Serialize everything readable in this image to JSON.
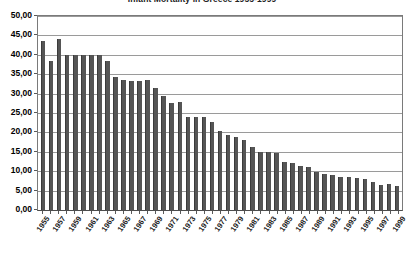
{
  "chart_data": {
    "type": "bar",
    "title": "Infant Mortality in Greece 1955-1999",
    "xlabel": "",
    "ylabel": "",
    "ylim": [
      0,
      50
    ],
    "ytick_step": 5,
    "grid": true,
    "legend": null,
    "decimal_separator": ",",
    "ytick_labels": [
      "50,00",
      "45,00",
      "40,00",
      "35,00",
      "30,00",
      "25,00",
      "20,00",
      "15,00",
      "10,00",
      "5,00",
      "0,00"
    ],
    "ytick_values": [
      50,
      45,
      40,
      35,
      30,
      25,
      20,
      15,
      10,
      5,
      0
    ],
    "xtick_labels": [
      "1955",
      "1957",
      "1959",
      "1961",
      "1963",
      "1965",
      "1967",
      "1969",
      "1971",
      "1973",
      "1975",
      "1977",
      "1979",
      "1981",
      "1983",
      "1985",
      "1987",
      "1989",
      "1991",
      "1993",
      "1995",
      "1997",
      "1999"
    ],
    "categories": [
      "1955",
      "1956",
      "1957",
      "1958",
      "1959",
      "1960",
      "1961",
      "1962",
      "1963",
      "1964",
      "1965",
      "1966",
      "1967",
      "1968",
      "1969",
      "1970",
      "1971",
      "1972",
      "1973",
      "1974",
      "1975",
      "1976",
      "1977",
      "1978",
      "1979",
      "1980",
      "1981",
      "1982",
      "1983",
      "1984",
      "1985",
      "1986",
      "1987",
      "1988",
      "1989",
      "1990",
      "1991",
      "1992",
      "1993",
      "1994",
      "1995",
      "1996",
      "1997",
      "1998",
      "1999"
    ],
    "values": [
      43.5,
      38.5,
      44.2,
      40.0,
      39.9,
      40.0,
      40.0,
      39.9,
      38.5,
      34.3,
      33.5,
      33.3,
      33.3,
      33.4,
      31.4,
      29.4,
      27.5,
      27.8,
      24.1,
      23.9,
      23.9,
      22.6,
      20.4,
      19.3,
      18.7,
      18.0,
      16.3,
      15.0,
      14.9,
      14.8,
      12.4,
      12.0,
      11.4,
      11.0,
      9.7,
      9.2,
      9.0,
      8.4,
      8.5,
      8.3,
      8.1,
      7.3,
      6.4,
      6.7,
      6.2
    ],
    "series_color": "#555555",
    "gridline_color": "#9a9a9a",
    "axis_color": "#4d4d4d",
    "background_color": "#ffffff"
  }
}
